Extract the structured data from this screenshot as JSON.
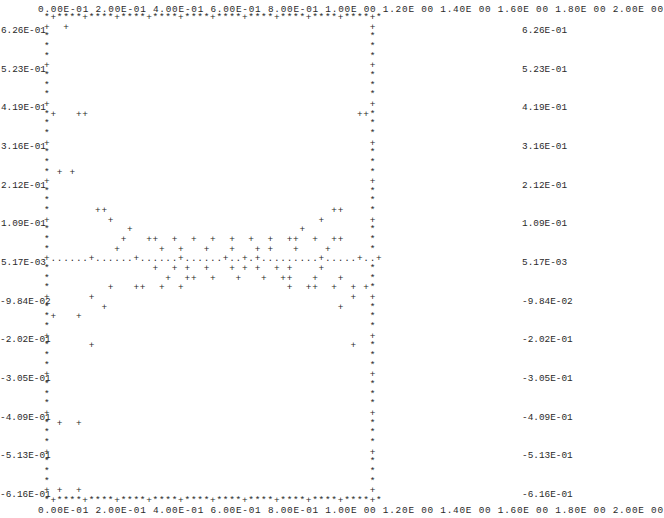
{
  "chart_data": {
    "type": "scatter",
    "title": "",
    "xlabel": "",
    "ylabel": "",
    "style": "line-printer ASCII plot",
    "xlim": [
      0.0,
      2.0
    ],
    "ylim": [
      -0.616,
      0.626
    ],
    "x_ticks": [
      "0.00E-01",
      "2.00E-01",
      "4.00E-01",
      "6.00E-01",
      "8.00E-01",
      "1.00E 00",
      "1.20E 00",
      "1.40E 00",
      "1.60E 00",
      "1.80E 00",
      "2.00E 00"
    ],
    "y_ticks": [
      "6.26E-01",
      "5.23E-01",
      "4.19E-01",
      "3.16E-01",
      "2.12E-01",
      "1.09E-01",
      "5.17E-03",
      "-9.84E-02",
      "-2.02E-01",
      "-3.05E-01",
      "-4.09E-01",
      "-5.13E-01",
      "-6.16E-01"
    ],
    "reference_line": {
      "y": 0.00517,
      "style": "dotted"
    },
    "grid": false,
    "legend": null,
    "points": [
      [
        0.12,
        0.626
      ],
      [
        0.04,
        0.402
      ],
      [
        0.2,
        0.402
      ],
      [
        0.24,
        0.402
      ],
      [
        1.96,
        0.402
      ],
      [
        2.0,
        0.402
      ],
      [
        0.08,
        0.238
      ],
      [
        0.12,
        0.238
      ],
      [
        0.32,
        0.135
      ],
      [
        0.36,
        0.135
      ],
      [
        1.88,
        0.135
      ],
      [
        1.92,
        0.135
      ],
      [
        0.4,
        0.109
      ],
      [
        1.8,
        0.109
      ],
      [
        0.52,
        0.083
      ],
      [
        1.72,
        0.083
      ],
      [
        0.48,
        0.057
      ],
      [
        0.68,
        0.057
      ],
      [
        0.72,
        0.057
      ],
      [
        0.88,
        0.057
      ],
      [
        1.04,
        0.057
      ],
      [
        1.12,
        0.057
      ],
      [
        1.24,
        0.057
      ],
      [
        1.36,
        0.057
      ],
      [
        1.44,
        0.057
      ],
      [
        1.48,
        0.057
      ],
      [
        1.64,
        0.057
      ],
      [
        1.68,
        0.057
      ],
      [
        0.44,
        0.031
      ],
      [
        0.8,
        0.031
      ],
      [
        0.96,
        0.031
      ],
      [
        1.16,
        0.031
      ],
      [
        1.28,
        0.031
      ],
      [
        1.32,
        0.031
      ],
      [
        1.52,
        0.031
      ],
      [
        1.56,
        0.031
      ],
      [
        1.76,
        0.031
      ],
      [
        0.28,
        0.005
      ],
      [
        0.56,
        0.005
      ],
      [
        0.64,
        0.005
      ],
      [
        0.76,
        0.005
      ],
      [
        0.92,
        0.005
      ],
      [
        1.0,
        0.005
      ],
      [
        1.2,
        0.005
      ],
      [
        1.4,
        0.005
      ],
      [
        1.6,
        0.005
      ],
      [
        1.84,
        0.005
      ],
      [
        1.96,
        0.005
      ],
      [
        0.6,
        -0.021
      ],
      [
        0.84,
        -0.021
      ],
      [
        0.88,
        -0.021
      ],
      [
        0.96,
        -0.021
      ],
      [
        1.08,
        -0.021
      ],
      [
        1.16,
        -0.021
      ],
      [
        1.2,
        -0.021
      ],
      [
        1.28,
        -0.021
      ],
      [
        1.52,
        -0.021
      ],
      [
        0.64,
        -0.047
      ],
      [
        0.76,
        -0.047
      ],
      [
        0.8,
        -0.047
      ],
      [
        0.92,
        -0.047
      ],
      [
        1.04,
        -0.047
      ],
      [
        1.12,
        -0.047
      ],
      [
        1.24,
        -0.047
      ],
      [
        1.36,
        -0.047
      ],
      [
        1.4,
        -0.047
      ],
      [
        1.56,
        -0.047
      ],
      [
        0.36,
        -0.073
      ],
      [
        0.52,
        -0.073
      ],
      [
        0.56,
        -0.073
      ],
      [
        0.68,
        -0.073
      ],
      [
        1.6,
        -0.073
      ],
      [
        1.68,
        -0.073
      ],
      [
        1.8,
        -0.073
      ],
      [
        1.84,
        -0.073
      ],
      [
        1.92,
        -0.073
      ],
      [
        0.24,
        -0.098
      ],
      [
        1.96,
        -0.098
      ],
      [
        0.32,
        -0.124
      ],
      [
        1.88,
        -0.124
      ],
      [
        0.04,
        -0.15
      ],
      [
        0.16,
        -0.15
      ],
      [
        0.2,
        -0.228
      ],
      [
        1.96,
        -0.228
      ],
      [
        0.08,
        -0.435
      ],
      [
        0.16,
        -0.435
      ],
      [
        0.04,
        -0.616
      ],
      [
        0.16,
        -0.616
      ]
    ]
  },
  "grid_rows": [
    "*+****+****+****+****+****+****+****+****+****+****+*",
    "+  +                                               +",
    "*                                                  *",
    "*                                                  *",
    "*                                                  *",
    "+                                                  +",
    "*                                                  *",
    "*                                                  *",
    "*                                                  *",
    "+                                                  +",
    "*+   ++                                          ++*",
    "*                                                  *",
    "*                                                  *",
    "+                                                  +",
    "*                                                  *",
    "*                                                  *",
    "* + +                                              *",
    "+                                                  +",
    "*                                                  *",
    "*                                                  *",
    "*       ++                                   ++    *",
    "+         +                                +       +",
    "*            +                          +          *",
    "*           +   ++  +  +  +  +  +  +  ++  +  ++    *",
    "*          +      +  +   +   +   + +   +    +      *",
    "+......+......+......+......+..+.+.........+.....+..+",
    "*                +  + +  +   + + +  + +    +       *",
    "*                  +  ++  +   +   +  ++   +   +    *",
    "*         +   ++  +  +                +  ++  +  + +*",
    "+      +                                        +  +",
    "*        +                                    +    *",
    "*+   +                                             *",
    "*                                                  *",
    "+                                                  +",
    "*      +                                        +  *",
    "*                                                  *",
    "*                                                  *",
    "+                                                  +",
    "*                                                  *",
    "*                                                  *",
    "*                                                  *",
    "+                                                  +",
    "* +  +                                             *",
    "*                                                  *",
    "*                                                  *",
    "+                                                  +",
    "*                                                  *",
    "*                                                  *",
    "*                                                  *",
    "+ +  +                                             +",
    "*+****+****+****+****+****+****+****+****+****+****+*"
  ],
  "x_tick_line": "0.00E-01 2.00E-01 4.00E-01 6.00E-01 8.00E-01 1.00E 00 1.20E 00 1.40E 00 1.60E 00 1.80E 00 2.00E 00"
}
